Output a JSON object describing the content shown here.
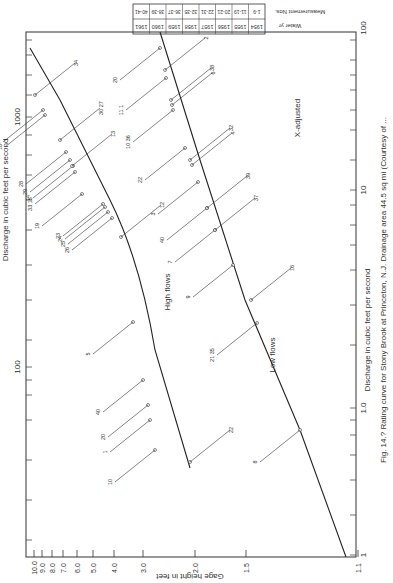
{
  "figure": {
    "caption": "Fig. 14.? Rating curve for Stony Brook at Princeton, N.J. Drainage area 44.5 sq mi (Courtesy of ...",
    "orientation": "rotated 90 degrees counter-clockwise"
  },
  "table": {
    "row_labels": [
      "Water yr",
      "Measurement Nos."
    ],
    "water_years": [
      "1954",
      "1955",
      "1956",
      "1957",
      "1958",
      "1959",
      "1960",
      "1961"
    ],
    "measurement_nos": [
      "1-9",
      "11-19",
      "20-21",
      "22-31",
      "32-35",
      "36-37",
      "38-39",
      "40-41"
    ]
  },
  "labels": {
    "high_flows": "High flows",
    "low_flows": "Low flows",
    "x_adjusted": "X-adjusted",
    "gage_axis": "Gage height in feet",
    "discharge_axis_high": "Discharge in cubic feet per second",
    "discharge_axis_low": "Discharge in cubic feet per second"
  },
  "chart_data": {
    "type": "line",
    "xlabel": "Gage height in feet",
    "ylabel": "Discharge in cubic feet per second",
    "x_scale": "log (gage height minus offset)",
    "x_ticks": [
      "1.1",
      "1.5",
      "2.0",
      "3.0",
      "4.0",
      "5.0",
      "6.0",
      "7.0",
      "8.0",
      "9.0",
      "10.0"
    ],
    "y_ticks_high_flows": [
      "100",
      "1000"
    ],
    "y_ticks_low_flows": [
      "1",
      "1.0",
      "10",
      "100"
    ],
    "grid": false,
    "series": [
      {
        "name": "High flows",
        "points": [
          {
            "gage": 2.0,
            "discharge": 45
          },
          {
            "gage": 2.5,
            "discharge": 90
          },
          {
            "gage": 3.0,
            "discharge": 160
          },
          {
            "gage": 3.5,
            "discharge": 300
          },
          {
            "gage": 4.0,
            "discharge": 500
          },
          {
            "gage": 5.0,
            "discharge": 800
          },
          {
            "gage": 6.0,
            "discharge": 1100
          },
          {
            "gage": 7.0,
            "discharge": 1500
          },
          {
            "gage": 8.0,
            "discharge": 2000
          },
          {
            "gage": 10.0,
            "discharge": 3000
          }
        ],
        "measurement_labels": [
          "22",
          "10",
          "1",
          "20",
          "40",
          "5",
          "12",
          "26",
          "25",
          "24",
          "23",
          "19",
          "33",
          "15",
          "14",
          "29",
          "28",
          "13",
          "30",
          "27",
          "18",
          "17",
          "34"
        ]
      },
      {
        "name": "Low flows",
        "points": [
          {
            "gage": 1.15,
            "discharge": 1
          },
          {
            "gage": 1.3,
            "discharge": 1.5
          },
          {
            "gage": 1.5,
            "discharge": 2.2
          },
          {
            "gage": 1.75,
            "discharge": 4
          },
          {
            "gage": 2.0,
            "discharge": 7
          },
          {
            "gage": 2.5,
            "discharge": 15
          },
          {
            "gage": 3.0,
            "discharge": 25
          },
          {
            "gage": 3.5,
            "discharge": 40
          },
          {
            "gage": 4.0,
            "discharge": 60
          },
          {
            "gage": 4.5,
            "discharge": 90
          }
        ],
        "measurement_labels": [
          "8",
          "21",
          "35",
          "16",
          "9",
          "7",
          "37",
          "40",
          "39",
          "3",
          "4",
          "32",
          "22",
          "10",
          "36",
          "6",
          "38",
          "11",
          "1",
          "2",
          "20"
        ]
      }
    ]
  }
}
